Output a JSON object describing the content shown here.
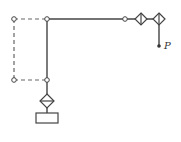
{
  "diagram": {
    "type": "kinematic-linkage",
    "colors": {
      "line": "#444444",
      "dashed": "#666666",
      "background": "#ffffff"
    },
    "point_label": "P",
    "nodes": [
      {
        "id": "top-left-joint",
        "kind": "revolute",
        "x": 14,
        "y": 19
      },
      {
        "id": "top-middle-joint",
        "kind": "revolute",
        "x": 47,
        "y": 19
      },
      {
        "id": "bottom-left-joint",
        "kind": "revolute",
        "x": 14,
        "y": 80
      },
      {
        "id": "bottom-middle-joint",
        "kind": "revolute",
        "x": 47,
        "y": 80
      },
      {
        "id": "horizontal-joint",
        "kind": "revolute",
        "x": 125,
        "y": 19
      },
      {
        "id": "prismatic-joint-1",
        "kind": "diamond",
        "x": 141,
        "y": 19
      },
      {
        "id": "prismatic-joint-2",
        "kind": "diamond",
        "x": 159,
        "y": 19
      },
      {
        "id": "vertical-prismatic-joint",
        "kind": "diamond",
        "x": 47,
        "y": 101
      },
      {
        "id": "end-point",
        "kind": "point",
        "x": 159,
        "y": 46
      }
    ],
    "base": {
      "kind": "rectangle",
      "x": 36,
      "y": 113,
      "width": 22,
      "height": 10
    }
  }
}
